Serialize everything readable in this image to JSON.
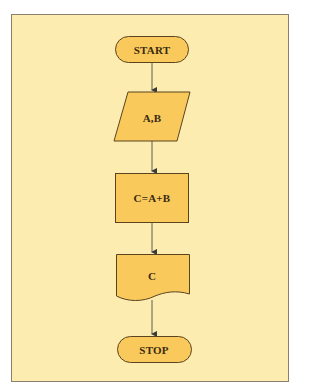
{
  "diagram": {
    "type": "flowchart",
    "colors": {
      "background": "#fcecb0",
      "shape_fill": "#f9c95c",
      "shape_stroke": "#5a4420",
      "arrow": "#3a3a3a",
      "frame_border": "#8a8070"
    },
    "nodes": [
      {
        "id": "start",
        "shape": "terminator",
        "label": "START"
      },
      {
        "id": "input",
        "shape": "parallelogram",
        "label": "A,B"
      },
      {
        "id": "process",
        "shape": "rectangle",
        "label": "C=A+B"
      },
      {
        "id": "output",
        "shape": "document",
        "label": "C"
      },
      {
        "id": "stop",
        "shape": "terminator",
        "label": "STOP"
      }
    ],
    "edges": [
      {
        "from": "start",
        "to": "input"
      },
      {
        "from": "input",
        "to": "process"
      },
      {
        "from": "process",
        "to": "output"
      },
      {
        "from": "output",
        "to": "stop"
      }
    ]
  }
}
